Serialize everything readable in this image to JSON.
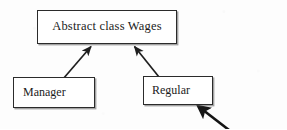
{
  "diagram": {
    "type": "class-inheritance-diagram",
    "background_color": "#fdfdfd",
    "stroke_color": "#2b2b2b",
    "text_color": "#1b1b1b",
    "nodes": [
      {
        "id": "wages",
        "label": "Abstract class Wages",
        "role": "superclass",
        "x": 37,
        "y": 10,
        "width": 140,
        "height": 34
      },
      {
        "id": "manager",
        "label": "Manager",
        "role": "subclass",
        "x": 13,
        "y": 77,
        "width": 82,
        "height": 31
      },
      {
        "id": "regular",
        "label": "Regular",
        "role": "subclass",
        "x": 143,
        "y": 76,
        "width": 70,
        "height": 29
      }
    ],
    "edges": [
      {
        "id": "manager-to-wages",
        "from": "manager",
        "to": "wages",
        "style": "solid-line-filled-arrowhead",
        "points": "63,79 92,46"
      },
      {
        "id": "regular-to-wages",
        "from": "regular",
        "to": "wages",
        "style": "solid-line-filled-arrowhead",
        "points": "159,77 134,46"
      }
    ],
    "annotations": [
      {
        "id": "pointer-to-regular",
        "label": "",
        "style": "hand-drawn-thick-arrow",
        "target": "regular",
        "points": "228,129 197,105"
      }
    ]
  }
}
